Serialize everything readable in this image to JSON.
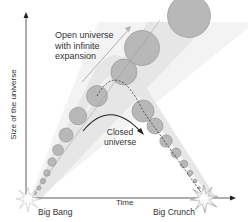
{
  "diagram": {
    "axes": {
      "x_label": "Time",
      "y_label": "Size of the universe"
    },
    "labels": {
      "open_universe": "Open universe\nwith infinite\nexpansion",
      "closed_universe": "Closed\nuniverse",
      "big_bang": "Big Bang",
      "big_crunch": "Big Crunch"
    },
    "colors": {
      "axis": "#333333",
      "band_fill": "#e6e6e6",
      "circle_fill": "#b8b8b8",
      "circle_stroke": "#8a8a8a",
      "arrow_open": "#aaaaaa",
      "arrow_closed": "#222222",
      "background": "#ffffff"
    },
    "paths": [
      {
        "name": "open-universe",
        "description": "Expanding cone from Big Bang up to top right, circles grow in size"
      },
      {
        "name": "closed-universe",
        "description": "Cone rises then falls to Big Crunch, circles shrink"
      }
    ]
  }
}
